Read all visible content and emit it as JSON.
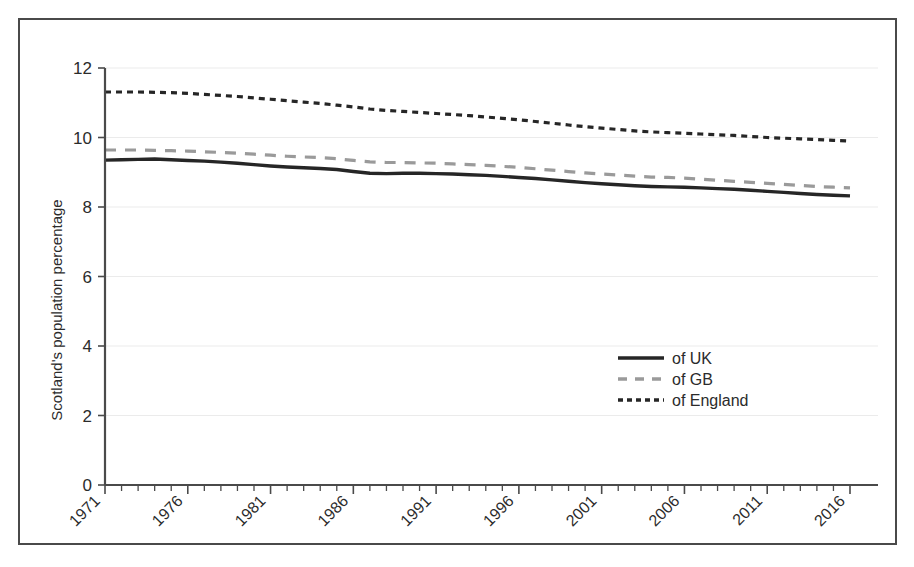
{
  "figure": {
    "frame_color": "#4a4a4a",
    "background": "#ffffff"
  },
  "axes": {
    "ylabel": "Scotland's population percentage",
    "ytick_labels": [
      "0",
      "2",
      "4",
      "6",
      "8",
      "10",
      "12"
    ],
    "xtick_labels": [
      "1971",
      "1976",
      "1981",
      "1986",
      "1991",
      "1996",
      "2001",
      "2006",
      "2011",
      "2016"
    ]
  },
  "legend": {
    "entries": [
      {
        "label": "of UK",
        "style": "solid",
        "color": "#262626"
      },
      {
        "label": "of GB",
        "style": "dashed",
        "color": "#9a9a9a"
      },
      {
        "label": "of England",
        "style": "dotted-dash",
        "color": "#262626"
      }
    ]
  },
  "chart_data": {
    "type": "line",
    "title": "",
    "subtitle": "",
    "xlabel": "",
    "ylabel": "Scotland's population percentage",
    "xlim": [
      1971,
      2016
    ],
    "ylim": [
      0,
      12
    ],
    "ytick_step": 2,
    "xtick_step": 5,
    "x_minor_tick_step": 1,
    "grid": "horizontal",
    "legend_position": "center-right",
    "x": [
      1971,
      1972,
      1973,
      1974,
      1975,
      1976,
      1977,
      1978,
      1979,
      1980,
      1981,
      1982,
      1983,
      1984,
      1985,
      1986,
      1987,
      1988,
      1989,
      1990,
      1991,
      1992,
      1993,
      1994,
      1995,
      1996,
      1997,
      1998,
      1999,
      2000,
      2001,
      2002,
      2003,
      2004,
      2005,
      2006,
      2007,
      2008,
      2009,
      2010,
      2011,
      2012,
      2013,
      2014,
      2015,
      2016
    ],
    "series": [
      {
        "name": "of UK",
        "style": "solid",
        "color": "#262626",
        "values": [
          9.35,
          9.36,
          9.37,
          9.38,
          9.36,
          9.34,
          9.32,
          9.29,
          9.26,
          9.22,
          9.18,
          9.15,
          9.13,
          9.11,
          9.08,
          9.02,
          8.97,
          8.96,
          8.97,
          8.97,
          8.96,
          8.95,
          8.93,
          8.91,
          8.88,
          8.85,
          8.82,
          8.78,
          8.74,
          8.7,
          8.67,
          8.64,
          8.61,
          8.59,
          8.58,
          8.57,
          8.55,
          8.53,
          8.51,
          8.48,
          8.45,
          8.42,
          8.39,
          8.36,
          8.34,
          8.32
        ]
      },
      {
        "name": "of GB",
        "style": "dashed",
        "color": "#9a9a9a",
        "values": [
          9.64,
          9.64,
          9.64,
          9.63,
          9.62,
          9.61,
          9.59,
          9.57,
          9.55,
          9.52,
          9.49,
          9.46,
          9.44,
          9.42,
          9.39,
          9.34,
          9.3,
          9.28,
          9.28,
          9.27,
          9.26,
          9.24,
          9.22,
          9.2,
          9.17,
          9.14,
          9.1,
          9.06,
          9.02,
          8.98,
          8.95,
          8.92,
          8.89,
          8.86,
          8.85,
          8.83,
          8.8,
          8.77,
          8.74,
          8.71,
          8.68,
          8.65,
          8.62,
          8.59,
          8.57,
          8.55
        ]
      },
      {
        "name": "of England",
        "style": "dotted-dash",
        "color": "#262626",
        "values": [
          11.31,
          11.31,
          11.31,
          11.3,
          11.29,
          11.27,
          11.24,
          11.21,
          11.18,
          11.14,
          11.1,
          11.06,
          11.02,
          10.98,
          10.93,
          10.88,
          10.82,
          10.78,
          10.75,
          10.72,
          10.69,
          10.66,
          10.63,
          10.59,
          10.55,
          10.51,
          10.46,
          10.41,
          10.36,
          10.31,
          10.27,
          10.23,
          10.19,
          10.16,
          10.14,
          10.12,
          10.1,
          10.08,
          10.06,
          10.03,
          10.0,
          9.98,
          9.96,
          9.94,
          9.92,
          9.9
        ]
      }
    ]
  }
}
